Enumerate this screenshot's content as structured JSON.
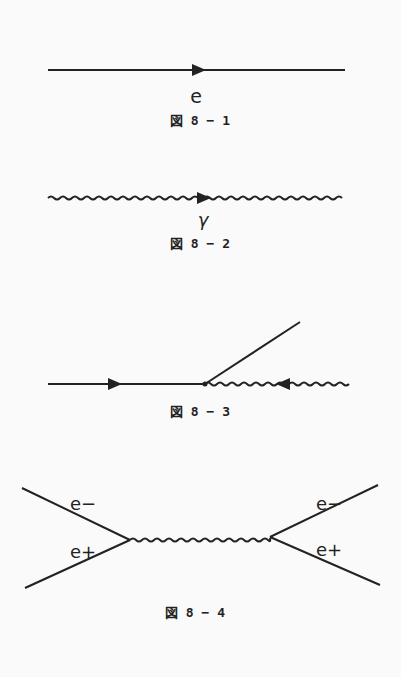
{
  "figures": [
    {
      "id": "fig-8-1",
      "caption": "図 8 − 1",
      "label": "e",
      "description": "Electron propagator: straight line with forward arrow"
    },
    {
      "id": "fig-8-2",
      "caption": "図 8 − 2",
      "label": "γ",
      "description": "Photon propagator: wavy line with forward arrow"
    },
    {
      "id": "fig-8-3",
      "caption": "図 8 − 3",
      "description": "Vertex: incoming electron line, outgoing electron diagonal line, incoming photon wavy line with arrow pointing toward vertex"
    },
    {
      "id": "fig-8-4",
      "caption": "図 8 − 4",
      "labels": {
        "left_top": "e−",
        "left_bottom": "e+",
        "right_top": "e−",
        "right_bottom": "e+"
      },
      "description": "Electron-positron annihilation and pair creation via virtual photon"
    }
  ],
  "colors": {
    "ink": "#222222",
    "background": "#fafafa"
  }
}
